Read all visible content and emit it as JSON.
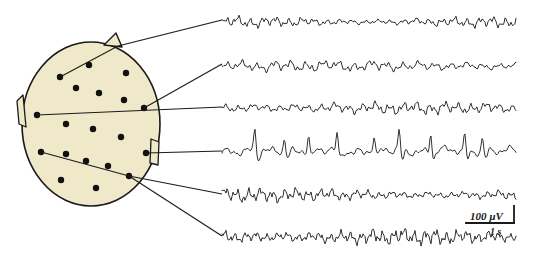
{
  "figure": {
    "background_color": "#ffffff",
    "ink_color": "#1a1a1a"
  },
  "head_map": {
    "name": "scalp-electrode-map",
    "fill_color": "#f0e9c9",
    "outline_color": "#1a1a1a",
    "center": {
      "cx": 91,
      "cy": 124
    },
    "radii": {
      "rx": 69,
      "ry": 82
    },
    "nose": {
      "label": "nose-marker",
      "points": "104,45 116,33 122,47"
    },
    "left_ear": {
      "label": "left-ear-marker",
      "points": "23,95 17,101 19,124 26,127"
    },
    "right_ear": {
      "label": "right-ear-marker",
      "points": "151,139 159,142 158,165 150,163"
    },
    "electrodes": [
      {
        "id": "e1",
        "x": 60,
        "y": 77,
        "r": 3.2
      },
      {
        "id": "e2",
        "x": 89,
        "y": 65,
        "r": 3.2
      },
      {
        "id": "e3",
        "x": 126,
        "y": 73,
        "r": 3.2
      },
      {
        "id": "e4",
        "x": 76,
        "y": 88,
        "r": 3.2
      },
      {
        "id": "e5",
        "x": 99,
        "y": 93,
        "r": 3.2
      },
      {
        "id": "e6",
        "x": 124,
        "y": 100,
        "r": 3.2
      },
      {
        "id": "e7",
        "x": 144,
        "y": 108,
        "r": 3.2
      },
      {
        "id": "e8",
        "x": 37,
        "y": 115,
        "r": 3.2
      },
      {
        "id": "e9",
        "x": 66,
        "y": 124,
        "r": 3.2
      },
      {
        "id": "e10",
        "x": 93,
        "y": 129,
        "r": 3.2
      },
      {
        "id": "e11",
        "x": 121,
        "y": 137,
        "r": 3.2
      },
      {
        "id": "e12",
        "x": 146,
        "y": 153,
        "r": 3.2
      },
      {
        "id": "e13",
        "x": 41,
        "y": 152,
        "r": 3.2
      },
      {
        "id": "e14",
        "x": 66,
        "y": 154,
        "r": 3.2
      },
      {
        "id": "e15",
        "x": 86,
        "y": 161,
        "r": 3.2
      },
      {
        "id": "e16",
        "x": 108,
        "y": 166,
        "r": 3.2
      },
      {
        "id": "e17",
        "x": 129,
        "y": 176,
        "r": 3.2
      },
      {
        "id": "e18",
        "x": 61,
        "y": 180,
        "r": 3.2
      },
      {
        "id": "e19",
        "x": 96,
        "y": 188,
        "r": 3.2
      }
    ],
    "leader_lines": [
      {
        "id": "L1",
        "from_electrode": "e1",
        "path": "60,77 118,46 222,20"
      },
      {
        "id": "L2",
        "from_electrode": "e7",
        "path": "144,108 222,64"
      },
      {
        "id": "L3",
        "from_electrode": "e8",
        "path": "37,115 222,107"
      },
      {
        "id": "L4",
        "from_electrode": "e12",
        "path": "146,153 222,151"
      },
      {
        "id": "L5",
        "from_electrode": "e13",
        "path": "41,152 129,176 222,194"
      },
      {
        "id": "L6",
        "from_electrode": "e17",
        "path": "129,176 222,236"
      }
    ]
  },
  "traces": {
    "name": "eeg-trace-panel",
    "x_start": 222,
    "x_end": 516,
    "stroke_color": "#1a1a1a",
    "stroke_width": 0.9,
    "channels": [
      {
        "id": "ch1",
        "label": "channel-1",
        "baseline_y": 22,
        "amplitude": 5.5,
        "density": 1.45,
        "seed": 11,
        "spikes": 0
      },
      {
        "id": "ch2",
        "label": "channel-2",
        "baseline_y": 66,
        "amplitude": 5.0,
        "density": 1.15,
        "seed": 23,
        "spikes": 0
      },
      {
        "id": "ch3",
        "label": "channel-3",
        "baseline_y": 108,
        "amplitude": 5.2,
        "density": 1.35,
        "seed": 37,
        "spikes": 0
      },
      {
        "id": "ch4",
        "label": "channel-4",
        "baseline_y": 151,
        "amplitude": 4.2,
        "density": 0.85,
        "seed": 53,
        "spikes": 9
      },
      {
        "id": "ch5",
        "label": "channel-5",
        "baseline_y": 195,
        "amplitude": 6.0,
        "density": 1.55,
        "seed": 71,
        "spikes": 0
      },
      {
        "id": "ch6",
        "label": "channel-6",
        "baseline_y": 237,
        "amplitude": 6.8,
        "density": 1.75,
        "seed": 89,
        "spikes": 0
      }
    ]
  },
  "scale_bar": {
    "name": "scale-bar",
    "voltage_label": "100 µV",
    "time_label": "1 s",
    "horizontal": {
      "x1": 466,
      "x2": 514,
      "y": 223
    },
    "vertical": {
      "x": 514,
      "y1": 206,
      "y2": 223
    },
    "voltage_label_pos": {
      "x": 470,
      "y": 220
    },
    "time_label_pos": {
      "x": 490,
      "y": 235
    }
  },
  "chart_data": {
    "type": "line",
    "xlabel": "time",
    "ylabel": "amplitude",
    "series": [
      {
        "name": "channel-1",
        "description": "low-amplitude mixed-frequency activity, fast rhythm at start, flattening mid-record"
      },
      {
        "name": "channel-2",
        "description": "low-amplitude irregular activity with slow drift near end"
      },
      {
        "name": "channel-3",
        "description": "continuous rhythmic low-voltage activity"
      },
      {
        "name": "channel-4",
        "description": "repetitive sharp high-amplitude spike-and-wave transients"
      },
      {
        "name": "channel-5",
        "description": "moderate-amplitude rhythmic alpha-like activity"
      },
      {
        "name": "channel-6",
        "description": "high-amplitude continuous irregular activity"
      }
    ],
    "scale": {
      "voltage": "100 µV",
      "time": "1 s"
    },
    "grid": false,
    "legend": "none"
  }
}
